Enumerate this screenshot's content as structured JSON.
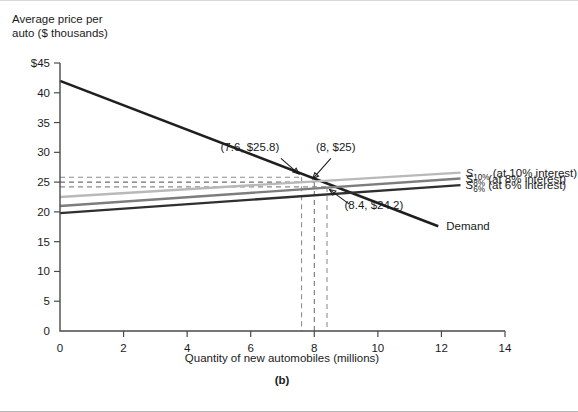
{
  "figure": {
    "panel_caption": "(b)",
    "ylabel_line1": "Average price per",
    "ylabel_line2": "auto ($ thousands)",
    "xlabel": "Quantity of new automobiles (millions)"
  },
  "chart_data": {
    "type": "line",
    "title": "",
    "xlabel": "Quantity of new automobiles (millions)",
    "ylabel": "Average price per auto ($ thousands)",
    "xlim": [
      0,
      14
    ],
    "ylim": [
      0,
      45
    ],
    "xticks": [
      0,
      2,
      4,
      6,
      8,
      10,
      12,
      14
    ],
    "xtick_labels": [
      "0",
      "2",
      "4",
      "6",
      "8",
      "10",
      "12",
      "14"
    ],
    "yticks": [
      0,
      5,
      10,
      15,
      20,
      25,
      30,
      35,
      40,
      45
    ],
    "ytick_labels": [
      "0",
      "5",
      "10",
      "15",
      "20",
      "25",
      "30",
      "35",
      "40",
      "$45"
    ],
    "grid": false,
    "legend_position": "right-inline",
    "series": [
      {
        "name": "Demand",
        "label": "Demand",
        "color": "#1f1f1f",
        "width": 2.6,
        "points": [
          [
            0,
            42.0
          ],
          [
            11.9,
            17.6
          ]
        ]
      },
      {
        "name": "S_10",
        "label": "S",
        "sublabel": "10%",
        "label_suffix": " (at 10% interest)",
        "color": "#b9b9b9",
        "width": 2.4,
        "points": [
          [
            0,
            22.5
          ],
          [
            12.6,
            26.6
          ]
        ]
      },
      {
        "name": "S_8",
        "label": "S",
        "sublabel": "8%",
        "label_suffix": " (at 8% interest)",
        "color": "#7d7d7d",
        "width": 2.4,
        "points": [
          [
            0,
            21.0
          ],
          [
            12.6,
            25.6
          ]
        ]
      },
      {
        "name": "S_6",
        "label": "S",
        "sublabel": "6%",
        "label_suffix": " (at 6% interest)",
        "color": "#2f2f2f",
        "width": 2.4,
        "points": [
          [
            0,
            19.8
          ],
          [
            12.6,
            24.5
          ]
        ]
      }
    ],
    "equilibria": [
      {
        "label": "(7.6, $25.8)",
        "x": 7.6,
        "y": 25.8,
        "text_x": 5.05,
        "text_y": 30.2,
        "arrow_from": [
          6.95,
          29.0
        ],
        "arrow_to": [
          7.52,
          26.35
        ]
      },
      {
        "label": "(8, $25)",
        "x": 8.0,
        "y": 25.0,
        "text_x": 8.05,
        "text_y": 30.2,
        "arrow_from": [
          8.52,
          29.0
        ],
        "arrow_to": [
          7.95,
          25.55
        ]
      },
      {
        "label": "(8.4, $24.2)",
        "x": 8.4,
        "y": 24.2,
        "text_x": 8.95,
        "text_y": 20.5,
        "arrow_from": [
          9.1,
          21.3
        ],
        "arrow_to": [
          8.48,
          23.75
        ]
      }
    ],
    "guide_lines": [
      {
        "name": "guide-25-8",
        "price": 25.8,
        "quantity": 7.6,
        "color": "#8c8c8c"
      },
      {
        "name": "guide-25-0",
        "price": 25.0,
        "quantity": 8.0,
        "color": "#6e6e6e"
      },
      {
        "name": "guide-24-2",
        "price": 24.2,
        "quantity": 8.4,
        "color": "#8c8c8c"
      }
    ],
    "annotations": [
      "(7.6, $25.8)",
      "(8, $25)",
      "(8.4, $24.2)"
    ],
    "legend_entries": [
      "S10% (at 10% interest)",
      "S8% (at 8% interest)",
      "S6% (at 6% interest)",
      "Demand"
    ]
  }
}
